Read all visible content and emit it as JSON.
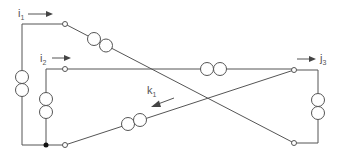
{
  "diagram": {
    "type": "three-phase transformer winding connection diagram",
    "colors": {
      "wire": "#555555",
      "junction": "#111111",
      "background": "#ffffff"
    },
    "labels": {
      "i1": {
        "main": "i",
        "sub": "1"
      },
      "i2": {
        "main": "i",
        "sub": "2"
      },
      "j3": {
        "main": "j",
        "sub": "3"
      },
      "k1": {
        "main": "k",
        "sub": "1"
      }
    },
    "nodes": [
      {
        "id": "terminal-i1",
        "x": 65,
        "y": 24
      },
      {
        "id": "terminal-i2",
        "x": 65,
        "y": 69
      },
      {
        "id": "terminal-bottom-left",
        "x": 65,
        "y": 145
      },
      {
        "id": "terminal-j3",
        "x": 294,
        "y": 70
      },
      {
        "id": "terminal-bottom-right",
        "x": 294,
        "y": 143
      },
      {
        "id": "junction",
        "x": 46,
        "y": 145
      }
    ],
    "windings": [
      {
        "id": "winding-left-outer",
        "orientation": "vertical"
      },
      {
        "id": "winding-left-inner",
        "orientation": "vertical"
      },
      {
        "id": "winding-diagonal-upper",
        "orientation": "diagonal"
      },
      {
        "id": "winding-horizontal-middle",
        "orientation": "horizontal"
      },
      {
        "id": "winding-diagonal-lower",
        "orientation": "diagonal"
      },
      {
        "id": "winding-right",
        "orientation": "vertical"
      }
    ]
  }
}
